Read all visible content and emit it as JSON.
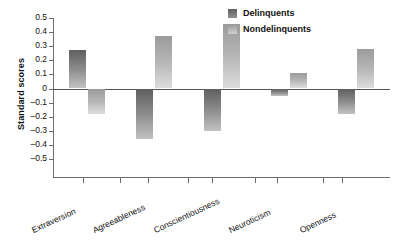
{
  "chart_data": {
    "type": "bar",
    "title": "",
    "xlabel": "",
    "ylabel": "Standard scores",
    "ylim": [
      -0.5,
      0.5
    ],
    "grid": false,
    "legend_position": "top-right",
    "categories": [
      "Extraversion",
      "Agreeableness",
      "Conscientiousness",
      "Neuroticism",
      "Openness"
    ],
    "ytick_labels": [
      "0.5",
      "0.4",
      "0.3",
      "0.2",
      "0.1",
      "0",
      "–0.1",
      "–0.2",
      "–0.3",
      "–0.4",
      "–0.5"
    ],
    "ytick_values": [
      0.5,
      0.4,
      0.3,
      0.2,
      0.1,
      0,
      -0.1,
      -0.2,
      -0.3,
      -0.4,
      -0.5
    ],
    "series": [
      {
        "name": "Delinquents",
        "color": "#6e6e6e",
        "values": [
          0.27,
          -0.36,
          -0.3,
          -0.05,
          -0.18
        ]
      },
      {
        "name": "Nondelinquents",
        "color": "#b0b0b0",
        "values": [
          -0.18,
          0.37,
          0.46,
          0.11,
          0.28
        ]
      }
    ]
  },
  "axis": {
    "y_title": "Standard scores"
  },
  "legend": {
    "items": [
      {
        "label": "Delinquents",
        "swatch": "delinquent-swatch"
      },
      {
        "label": "Nondelinquents",
        "swatch": "nondelinquent-swatch"
      }
    ]
  }
}
